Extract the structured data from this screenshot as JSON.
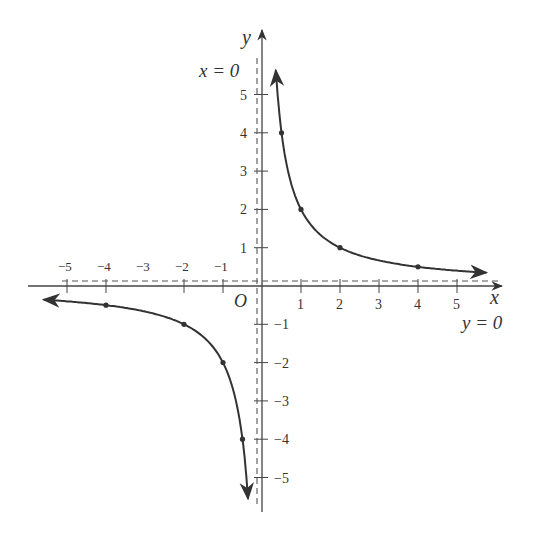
{
  "chart_data": {
    "type": "line",
    "title": "",
    "function": "y = 2/x",
    "xlabel": "x",
    "ylabel": "y",
    "origin_label": "O",
    "xlim": [
      -5.5,
      5.8
    ],
    "ylim": [
      -5.8,
      6.2
    ],
    "x_ticks": [
      -5,
      -4,
      -2,
      -1,
      1,
      2,
      3,
      4,
      5
    ],
    "x_tick_labels": [
      "-5",
      "-4",
      "-3",
      "-2",
      "-1",
      "1",
      "2",
      "3",
      "4",
      "5"
    ],
    "y_ticks": [
      -5,
      -4,
      -3,
      -2,
      -1,
      1,
      2,
      3,
      4,
      5
    ],
    "y_tick_labels": [
      "-5",
      "-4",
      "-3",
      "-2",
      "-1",
      "1",
      "2",
      "3",
      "4",
      "5"
    ],
    "grid": false,
    "asymptotes": [
      {
        "label": "x = 0",
        "type": "vertical",
        "style": "dashed"
      },
      {
        "label": "y = 0",
        "type": "horizontal",
        "style": "dashed"
      }
    ],
    "series": [
      {
        "name": "branch-positive",
        "x": [
          0.5,
          1,
          2,
          4
        ],
        "y": [
          4,
          2,
          1,
          0.5
        ]
      },
      {
        "name": "branch-negative",
        "x": [
          -4,
          -2,
          -1,
          -0.5
        ],
        "y": [
          -0.5,
          -1,
          -2,
          -4
        ]
      }
    ],
    "marked_points": [
      [
        0.5,
        4
      ],
      [
        1,
        2
      ],
      [
        2,
        1
      ],
      [
        4,
        0.5
      ],
      [
        -4,
        -0.5
      ],
      [
        -2,
        -1
      ],
      [
        -1,
        -2
      ],
      [
        -0.5,
        -4
      ]
    ]
  },
  "labels": {
    "x_axis": "x",
    "y_axis": "y",
    "origin": "O",
    "vertical_asymptote": "x = 0",
    "horizontal_asymptote": "y = 0"
  }
}
